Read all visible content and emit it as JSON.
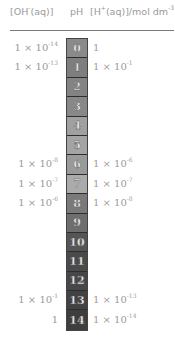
{
  "header": {
    "oh_label": "[OH",
    "oh_sup": "-",
    "oh_suffix": "(aq)]",
    "ph_label": "pH",
    "h_label": "[H",
    "h_sup": "+",
    "h_suffix": "(aq)]/mol dm",
    "h_unit_sup": "-3"
  },
  "ph_scale": [
    {
      "ph": "0",
      "color": "#8a8a8a",
      "oh": "1 × 10",
      "oh_exp": "-14",
      "h": "1",
      "h_exp": ""
    },
    {
      "ph": "1",
      "color": "#7e7e7e",
      "oh": "1 × 10",
      "oh_exp": "-13",
      "h": "1 × 10",
      "h_exp": "-1"
    },
    {
      "ph": "2",
      "color": "#838383",
      "oh": "",
      "oh_exp": "",
      "h": "",
      "h_exp": ""
    },
    {
      "ph": "3",
      "color": "#888888",
      "oh": "",
      "oh_exp": "",
      "h": "",
      "h_exp": ""
    },
    {
      "ph": "4",
      "color": "#a0a0a0",
      "oh": "",
      "oh_exp": "",
      "h": "",
      "h_exp": ""
    },
    {
      "ph": "5",
      "color": "#a4a4a4",
      "oh": "",
      "oh_exp": "",
      "h": "",
      "h_exp": ""
    },
    {
      "ph": "6",
      "color": "#9a9a9a",
      "oh": "1 × 10",
      "oh_exp": "-8",
      "h": "1 × 10",
      "h_exp": "-6"
    },
    {
      "ph": "7",
      "color": "#ababab",
      "oh": "1 × 10",
      "oh_exp": "-7",
      "h": "1 × 10",
      "h_exp": "-7"
    },
    {
      "ph": "8",
      "color": "#7a7a7a",
      "oh": "1 × 10",
      "oh_exp": "-6",
      "h": "1 × 10",
      "h_exp": "-8"
    },
    {
      "ph": "9",
      "color": "#6e6e6e",
      "oh": "",
      "oh_exp": "",
      "h": "",
      "h_exp": ""
    },
    {
      "ph": "10",
      "color": "#555555",
      "oh": "",
      "oh_exp": "",
      "h": "",
      "h_exp": ""
    },
    {
      "ph": "11",
      "color": "#4a4a4a",
      "oh": "",
      "oh_exp": "",
      "h": "",
      "h_exp": ""
    },
    {
      "ph": "12",
      "color": "#474747",
      "oh": "",
      "oh_exp": "",
      "h": "",
      "h_exp": ""
    },
    {
      "ph": "13",
      "color": "#424242",
      "oh": "1 × 10",
      "oh_exp": "-1",
      "h": "1 × 10",
      "h_exp": "-13"
    },
    {
      "ph": "14",
      "color": "#3e3e3e",
      "oh": "1",
      "oh_exp": "",
      "h": "1 × 10",
      "h_exp": "-14"
    }
  ]
}
